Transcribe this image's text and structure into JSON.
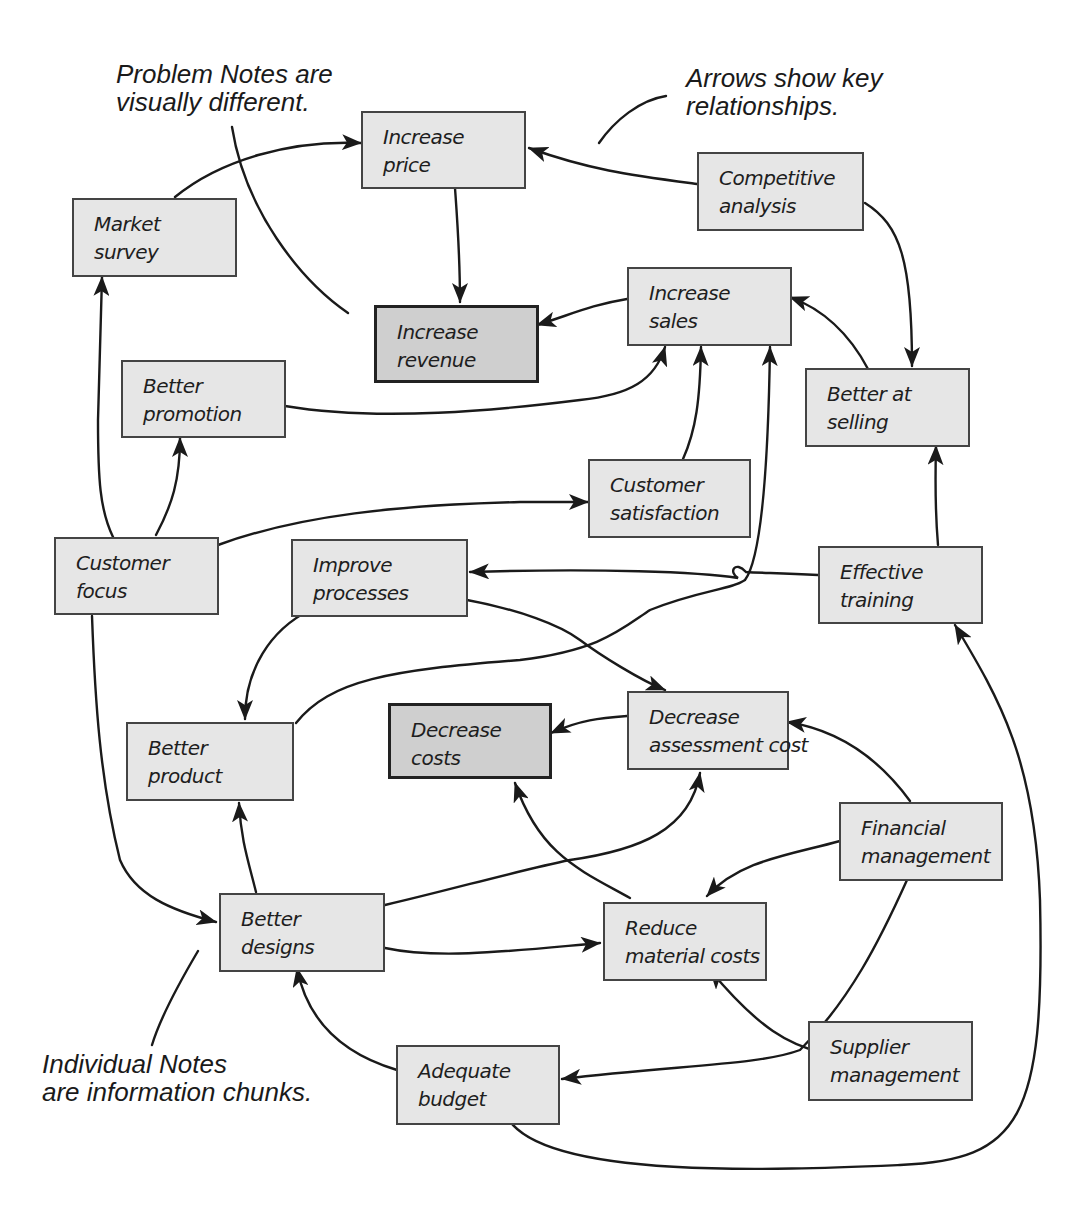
{
  "callouts": {
    "problem_notes": {
      "line1": "Problem Notes are",
      "line2": "visually different."
    },
    "arrows": {
      "line1": "Arrows show key",
      "line2": "relationships."
    },
    "individual_notes": {
      "line1": "Individual Notes",
      "line2": "are information chunks."
    }
  },
  "notes": {
    "increase_price": {
      "line1": "Increase",
      "line2": "price",
      "type": "note"
    },
    "market_survey": {
      "line1": "Market",
      "line2": "survey",
      "type": "note"
    },
    "competitive_analysis": {
      "line1": "Competitive",
      "line2": "analysis",
      "type": "note"
    },
    "increase_revenue": {
      "line1": "Increase",
      "line2": "revenue",
      "type": "problem"
    },
    "increase_sales": {
      "line1": "Increase",
      "line2": "sales",
      "type": "note"
    },
    "better_promotion": {
      "line1": "Better",
      "line2": "promotion",
      "type": "note"
    },
    "better_at_selling": {
      "line1": "Better at",
      "line2": "selling",
      "type": "note"
    },
    "customer_satisfaction": {
      "line1": "Customer",
      "line2": "satisfaction",
      "type": "note"
    },
    "customer_focus": {
      "line1": "Customer",
      "line2": "focus",
      "type": "note"
    },
    "improve_processes": {
      "line1": "Improve",
      "line2": "processes",
      "type": "note"
    },
    "effective_training": {
      "line1": "Effective",
      "line2": "training",
      "type": "note"
    },
    "better_product": {
      "line1": "Better",
      "line2": "product",
      "type": "note"
    },
    "decrease_costs": {
      "line1": "Decrease",
      "line2": "costs",
      "type": "problem"
    },
    "decrease_assessment_cost": {
      "line1": "Decrease",
      "line2": "assessment cost",
      "type": "note"
    },
    "financial_management": {
      "line1": "Financial",
      "line2": "management",
      "type": "note"
    },
    "better_designs": {
      "line1": "Better",
      "line2": "designs",
      "type": "note"
    },
    "reduce_material_costs": {
      "line1": "Reduce",
      "line2": "material costs",
      "type": "note"
    },
    "supplier_management": {
      "line1": "Supplier",
      "line2": "management",
      "type": "note"
    },
    "adequate_budget": {
      "line1": "Adequate",
      "line2": "budget",
      "type": "note"
    }
  },
  "relationships": [
    {
      "from": "Market survey",
      "to": "Increase price"
    },
    {
      "from": "Competitive analysis",
      "to": "Increase price"
    },
    {
      "from": "Increase price",
      "to": "Increase revenue"
    },
    {
      "from": "Increase sales",
      "to": "Increase revenue"
    },
    {
      "from": "Competitive analysis",
      "to": "Better at selling"
    },
    {
      "from": "Better at selling",
      "to": "Increase sales"
    },
    {
      "from": "Better promotion",
      "to": "Increase sales"
    },
    {
      "from": "Customer satisfaction",
      "to": "Increase sales"
    },
    {
      "from": "Better product",
      "to": "Increase sales"
    },
    {
      "from": "Customer focus",
      "to": "Market survey"
    },
    {
      "from": "Customer focus",
      "to": "Better promotion"
    },
    {
      "from": "Customer focus",
      "to": "Customer satisfaction"
    },
    {
      "from": "Customer focus",
      "to": "Better designs"
    },
    {
      "from": "Effective training",
      "to": "Better at selling"
    },
    {
      "from": "Effective training",
      "to": "Improve processes"
    },
    {
      "from": "Improve processes",
      "to": "Better product"
    },
    {
      "from": "Improve processes",
      "to": "Decrease assessment cost"
    },
    {
      "from": "Decrease assessment cost",
      "to": "Decrease costs"
    },
    {
      "from": "Financial management",
      "to": "Decrease assessment cost"
    },
    {
      "from": "Financial management",
      "to": "Reduce material costs"
    },
    {
      "from": "Financial management",
      "to": "Adequate budget"
    },
    {
      "from": "Better designs",
      "to": "Better product"
    },
    {
      "from": "Better designs",
      "to": "Decrease assessment cost"
    },
    {
      "from": "Better designs",
      "to": "Reduce material costs"
    },
    {
      "from": "Reduce material costs",
      "to": "Decrease costs"
    },
    {
      "from": "Supplier management",
      "to": "Reduce material costs"
    },
    {
      "from": "Adequate budget",
      "to": "Better designs"
    },
    {
      "from": "Adequate budget",
      "to": "Effective training"
    }
  ]
}
